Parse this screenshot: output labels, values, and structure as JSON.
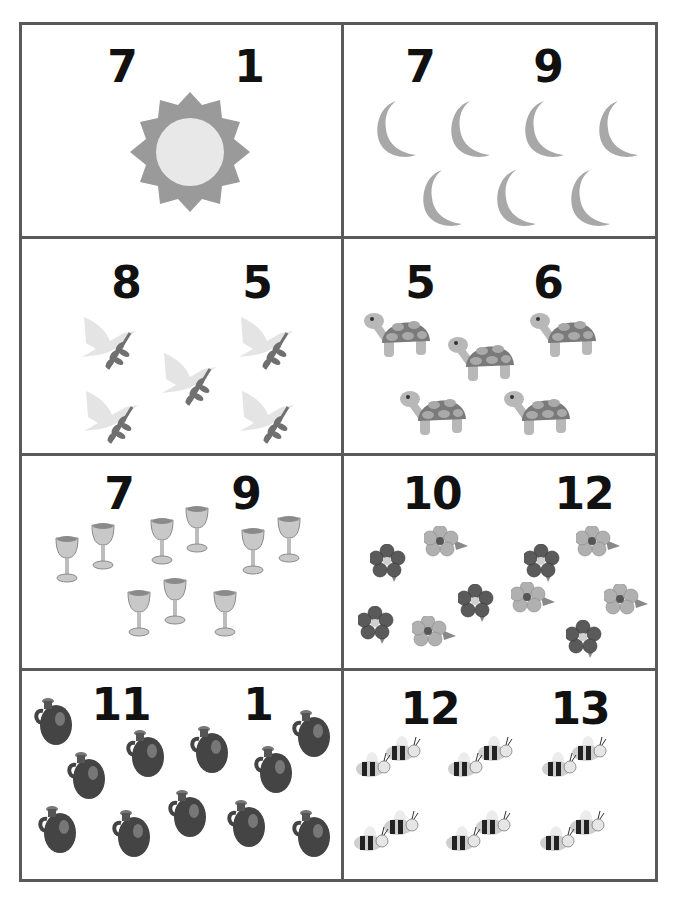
{
  "worksheet": {
    "type": "counting cards",
    "cells": [
      {
        "id": "sun",
        "object": "sun-icon",
        "count": 1,
        "options": [
          "7",
          "1"
        ],
        "colors": {
          "rays": "#9a9a9a",
          "core": "#e8e8e8"
        }
      },
      {
        "id": "moons",
        "object": "moon-icon",
        "count": 7,
        "options": [
          "7",
          "9"
        ],
        "colors": {
          "fill": "#a8a8a8"
        }
      },
      {
        "id": "doves",
        "object": "dove-icon",
        "count": 5,
        "options": [
          "8",
          "5"
        ],
        "colors": {
          "wing": "#e4e4e4",
          "branch": "#707070"
        }
      },
      {
        "id": "turtles",
        "object": "turtle-icon",
        "count": 5,
        "options": [
          "5",
          "6"
        ],
        "colors": {
          "shell": "#7a7a7a",
          "spots": "#a9a9a9",
          "body": "#b8b8b8"
        }
      },
      {
        "id": "goblets",
        "object": "goblet-icon",
        "count": 9,
        "options": [
          "7",
          "9"
        ],
        "colors": {
          "metal": "#c8c8c8",
          "shade": "#8a8a8a"
        }
      },
      {
        "id": "flowers",
        "object": "flower-icon",
        "count": 10,
        "options": [
          "10",
          "12"
        ],
        "colors": {
          "dark": "#5a5a5a",
          "light": "#b0b0b0"
        }
      },
      {
        "id": "jugs",
        "object": "jug-icon",
        "count": 11,
        "options": [
          "11",
          "1"
        ],
        "colors": {
          "body": "#444444",
          "highlight": "#777777"
        }
      },
      {
        "id": "bees",
        "object": "bee-icon",
        "count": 12,
        "options": [
          "12",
          "13"
        ],
        "colors": {
          "stripe": "#222222",
          "band": "#cfcfcf"
        }
      }
    ]
  }
}
